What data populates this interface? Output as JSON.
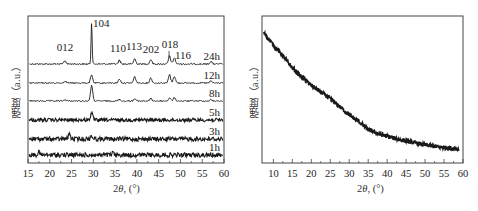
{
  "chart_data": [
    {
      "type": "line",
      "title": "",
      "xlabel_prefix": "2",
      "xlabel_theta": "θ",
      "xlabel_suffix": ", (°)",
      "xlabel": "2θ, (°)",
      "ylabel": "强度（a.u.）",
      "xlim": [
        15,
        60
      ],
      "xticks": [
        15,
        20,
        25,
        30,
        35,
        40,
        45,
        50,
        55,
        60
      ],
      "yticks": [],
      "grid": false,
      "legend_position": "inline-right",
      "peak_labels": [
        {
          "label": "012",
          "x": 23.5
        },
        {
          "label": "104",
          "x": 29.6
        },
        {
          "label": "110",
          "x": 36.0
        },
        {
          "label": "113",
          "x": 39.5
        },
        {
          "label": "202",
          "x": 43.2
        },
        {
          "label": "018",
          "x": 47.5
        },
        {
          "label": "116",
          "x": 48.6
        }
      ],
      "series": [
        {
          "name": "24h",
          "baseline_offset": 5,
          "noise": 0.35,
          "peaks": [
            [
              23.5,
              1.2
            ],
            [
              29.6,
              16
            ],
            [
              36.0,
              1.4
            ],
            [
              39.5,
              2.0
            ],
            [
              43.2,
              1.7
            ],
            [
              47.5,
              3.0
            ],
            [
              48.6,
              2.4
            ],
            [
              57.0,
              1.0
            ]
          ]
        },
        {
          "name": "12h",
          "baseline_offset": 4,
          "noise": 0.3,
          "peaks": [
            [
              23.5,
              0.8
            ],
            [
              29.6,
              3.0
            ],
            [
              36.0,
              1.5
            ],
            [
              39.5,
              2.4
            ],
            [
              43.2,
              2.0
            ],
            [
              47.5,
              3.2
            ],
            [
              48.6,
              2.6
            ],
            [
              57.0,
              0.8
            ]
          ]
        },
        {
          "name": "8h",
          "baseline_offset": 3,
          "noise": 0.3,
          "peaks": [
            [
              23.5,
              0.5
            ],
            [
              29.6,
              6.0
            ],
            [
              36.0,
              0.6
            ],
            [
              39.5,
              0.8
            ],
            [
              43.2,
              0.9
            ],
            [
              47.5,
              1.2
            ],
            [
              48.6,
              1.2
            ],
            [
              57.0,
              0.5
            ]
          ]
        },
        {
          "name": "5h",
          "baseline_offset": 2,
          "noise": 0.8,
          "peaks": [
            [
              29.6,
              2.8
            ]
          ]
        },
        {
          "name": "3h",
          "baseline_offset": 1,
          "noise": 1.0,
          "peaks": [
            [
              24.5,
              2.0
            ],
            [
              29.6,
              1.2
            ]
          ]
        },
        {
          "name": "1h",
          "baseline_offset": 0,
          "noise": 1.0,
          "peaks": [
            [
              17.5,
              1.0
            ],
            [
              34.5,
              0.8
            ]
          ]
        }
      ]
    },
    {
      "type": "line",
      "title": "",
      "xlabel": "2θ, (°)",
      "ylabel": "强度（a.u.）",
      "xlim": [
        7,
        60
      ],
      "xticks": [
        10,
        15,
        20,
        25,
        30,
        35,
        40,
        45,
        50,
        55,
        60
      ],
      "yticks": [],
      "grid": false,
      "series": [
        {
          "name": "amorphous",
          "x": [
            7.5,
            10,
            12.5,
            15,
            17.5,
            20,
            22.5,
            25,
            27.5,
            30,
            32.5,
            35,
            37.5,
            40,
            42.5,
            45,
            47.5,
            50,
            52.5,
            55,
            57.5,
            59
          ],
          "values": [
            100,
            91,
            83,
            74,
            67,
            61,
            56,
            51,
            45,
            39,
            34,
            28,
            25,
            23,
            21,
            19.5,
            18,
            16.5,
            15.5,
            14.5,
            14,
            13.5
          ]
        }
      ]
    }
  ],
  "left_panel": {
    "ylabel": "强度（a.u.）",
    "xlabel_prefix": "2",
    "xlabel_theta": "θ",
    "xlabel_suffix": ", (°)"
  },
  "right_panel": {
    "ylabel": "强度（a.u.）",
    "xlabel_prefix": "2",
    "xlabel_theta": "θ",
    "xlabel_suffix": ", (°)"
  },
  "style": {
    "line_color": "#1a1a1a",
    "axis_color": "#444444"
  }
}
